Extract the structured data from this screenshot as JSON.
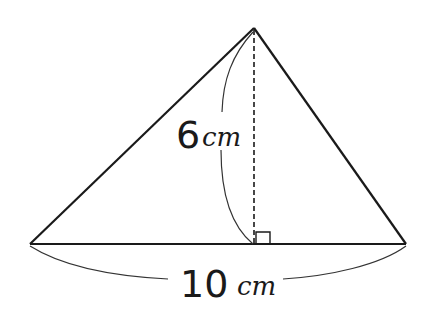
{
  "diagram": {
    "type": "triangle-area",
    "height_label": {
      "value": "6",
      "unit": "cm"
    },
    "base_label": {
      "value": "10",
      "unit": "cm"
    },
    "colors": {
      "stroke": "#1a1a1a",
      "background": "#ffffff"
    }
  }
}
